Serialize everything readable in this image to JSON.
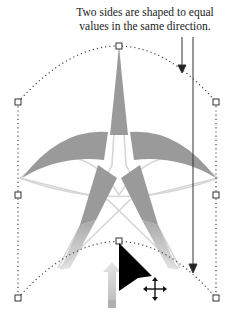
{
  "caption": {
    "line1": "Two sides are shaped to equal",
    "line2": "values in the same direction."
  },
  "colors": {
    "star_fill": "#9a9a9a",
    "star_outline": "#d6d6d6",
    "handle_stroke": "#333333",
    "dotted_path": "#444444",
    "callout_line": "#333333",
    "cursor": "#000000",
    "up_arrow": "#c8c8c8"
  },
  "handles": [
    {
      "name": "top-center",
      "x": 119,
      "y": 46
    },
    {
      "name": "upper-left",
      "x": 18,
      "y": 102
    },
    {
      "name": "upper-right",
      "x": 216,
      "y": 102
    },
    {
      "name": "middle-left",
      "x": 18,
      "y": 195
    },
    {
      "name": "middle-right",
      "x": 216,
      "y": 195
    },
    {
      "name": "bottom-center",
      "x": 119,
      "y": 241
    },
    {
      "name": "bottom-left",
      "x": 18,
      "y": 298
    },
    {
      "name": "bottom-right",
      "x": 216,
      "y": 298
    }
  ],
  "icons": {
    "cursor": "arrow-pointer-icon",
    "move": "move-cross-icon",
    "direction": "up-arrow-icon"
  }
}
